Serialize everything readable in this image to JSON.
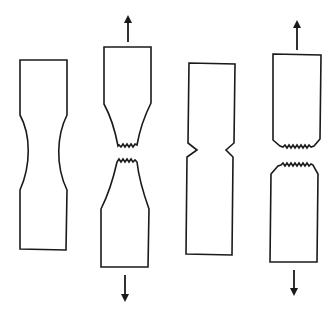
{
  "figure": {
    "stroke_color": "#1a1a1a",
    "background": "#ffffff"
  },
  "specimens": [
    {
      "id": "specimen-1",
      "state": "ductile-necked-unbroken",
      "path": "M20,60 L67,60 L67,115 C57,135 55,165 67,190 L66,250 L20,249 L20,190 C31,165 31,135 20,115 Z"
    },
    {
      "id": "specimen-2",
      "state": "ductile-fractured",
      "top_path": "M104,47 L151,47 L151,103 C145,115 140,128 137,145 L135,144 L133,147 L131,144 L129,147 L127,144 L125,147 L123,144 L121,147 L119,145 L118,146 C115,130 110,115 104,104 Z",
      "bottom_path": "M117,162 L119,159 L121,162 L123,159 L125,162 L127,159 L129,162 L131,159 L133,162 L135,160 L137,162 C139,180 144,195 149,209 L148,267 L101,267 L101,209 C108,195 113,180 117,162 Z",
      "arrow_up": {
        "x": 128,
        "y1": 42,
        "y2": 15
      },
      "arrow_down": {
        "x": 125,
        "y1": 275,
        "y2": 302
      }
    },
    {
      "id": "specimen-3",
      "state": "notched-unbroken",
      "path": "M189,63 L235,64 L234,143 L226,150 L233,157 L232,255 L186,254 L187,157 L197,150 L188,143 Z"
    },
    {
      "id": "specimen-4",
      "state": "brittle-fractured",
      "top_path": "M273,54 L321,55 L320,139 L314,146 L311,147 L309,145 L307,148 L305,145 L303,148 L301,145 L299,148 L297,145 L295,148 L293,145 L291,148 L289,145 L287,148 L285,145 L283,147 L280,146 L273,140 Z",
      "bottom_path": "M271,174 L278,166 L281,165 L283,163 L285,166 L287,163 L289,166 L291,163 L293,166 L295,163 L297,166 L299,163 L301,166 L303,163 L305,166 L307,163 L309,166 L311,164 L313,165 L318,174 L317,262 L270,262 Z",
      "arrow_up": {
        "x": 297,
        "y1": 50,
        "y2": 20
      },
      "arrow_down": {
        "x": 294,
        "y1": 270,
        "y2": 296
      }
    }
  ]
}
